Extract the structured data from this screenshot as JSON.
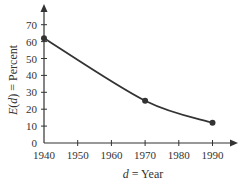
{
  "chart_data": {
    "type": "line",
    "title": "",
    "xlabel": "d = Year",
    "ylabel": "E(d) = Percent",
    "xlabel_parts": {
      "var": "d",
      "rest": " = Year"
    },
    "ylabel_parts": {
      "var": "E",
      "open": "(",
      "arg": "d",
      "close": ")",
      "rest": " = Percent"
    },
    "x_ticks": [
      1940,
      1950,
      1960,
      1970,
      1980,
      1990
    ],
    "y_ticks": [
      0,
      10,
      20,
      30,
      40,
      50,
      60,
      70
    ],
    "xlim": [
      1940,
      1996
    ],
    "ylim": [
      0,
      78
    ],
    "grid": false,
    "legend": null,
    "series": [
      {
        "name": "E(d)",
        "points": [
          {
            "x": 1940,
            "y": 62
          },
          {
            "x": 1970,
            "y": 25
          },
          {
            "x": 1990,
            "y": 12
          }
        ],
        "curve": "smooth decreasing",
        "color": "#333333"
      }
    ]
  }
}
